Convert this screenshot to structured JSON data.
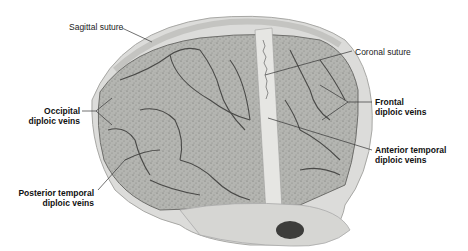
{
  "figure": {
    "colors": {
      "bone": "#d8d8d6",
      "bone_shadow": "#b9b9b6",
      "diploe": "#a9aaa6",
      "vein": "#4a4a48",
      "leader": "#333333",
      "label_text": "#111111"
    }
  },
  "labels": {
    "sagittal_suture": "Sagittal suture",
    "coronal_suture": "Coronal suture",
    "occipital": {
      "line1": "Occipital",
      "line2": "diploic veins"
    },
    "frontal": {
      "line1": "Frontal",
      "line2": "diploic veins"
    },
    "anterior_temporal": {
      "line1": "Anterior temporal",
      "line2": "diploic veins"
    },
    "posterior_temporal": {
      "line1": "Posterior temporal",
      "line2": "diploic veins"
    }
  }
}
